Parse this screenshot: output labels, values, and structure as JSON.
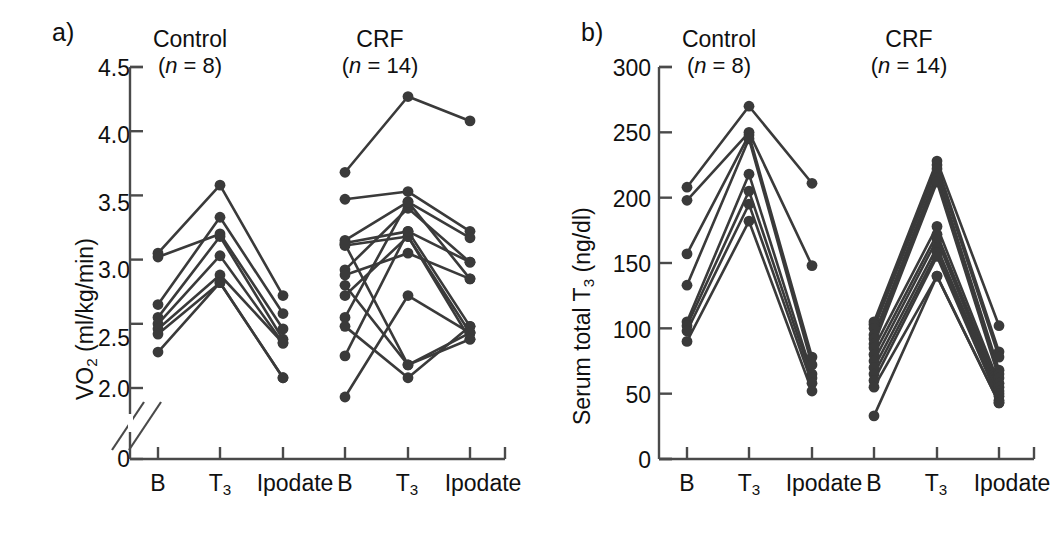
{
  "figure": {
    "panel_a_label": "a)",
    "panel_b_label": "b)"
  },
  "panel_a": {
    "ylabel_main": "VO",
    "ylabel_sub": "2",
    "ylabel_rest": " (ml/kg/min)",
    "ylabel_full": "VO2 (ml/kg/min)",
    "groups": [
      {
        "name": "Control",
        "n_text": "n",
        "n_value": " = 8)",
        "n_open": "("
      },
      {
        "name": "CRF",
        "n_text": "n",
        "n_value": " = 14)",
        "n_open": "("
      }
    ],
    "ytick_labels": [
      "4.5",
      "4.0",
      "3.5",
      "3.0",
      "2.5",
      "2.0",
      "0"
    ],
    "xtick_labels": [
      "B",
      "T3",
      "Ipodate",
      "B",
      "T3",
      "Ipodate"
    ],
    "xtick_base": [
      "B",
      "T",
      "Ipodate",
      "B",
      "T",
      "Ipodate"
    ],
    "xtick_sub": [
      "",
      "3",
      "",
      "",
      "3",
      ""
    ]
  },
  "panel_b": {
    "ylabel_main": "Serum total T",
    "ylabel_sub": "3",
    "ylabel_rest": " (ng/dl)",
    "ylabel_full": "Serum total T3 (ng/dl)",
    "groups": [
      {
        "name": "Control",
        "n_text": "n",
        "n_value": " = 8)",
        "n_open": "("
      },
      {
        "name": "CRF",
        "n_text": "n",
        "n_value": " = 14)",
        "n_open": "("
      }
    ],
    "ytick_labels": [
      "300",
      "250",
      "200",
      "150",
      "100",
      "50",
      "0"
    ],
    "xtick_labels": [
      "B",
      "T3",
      "Ipodate",
      "B",
      "T3",
      "Ipodate"
    ],
    "xtick_base": [
      "B",
      "T",
      "Ipodate",
      "B",
      "T",
      "Ipodate"
    ],
    "xtick_sub": [
      "",
      "3",
      "",
      "",
      "3",
      ""
    ]
  },
  "chart_data": [
    {
      "panel": "a",
      "type": "line",
      "title": "",
      "xlabel": "",
      "ylabel": "VO2 (ml/kg/min)",
      "ylim": [
        2.0,
        4.5
      ],
      "yticks": [
        2.0,
        2.5,
        3.0,
        3.5,
        4.0,
        4.5
      ],
      "y_axis_break": true,
      "y_break_note": "axis broken between 0 and 2.0",
      "grid": false,
      "legend": "none",
      "categories": [
        "B",
        "T3",
        "Ipodate"
      ],
      "groups": [
        {
          "name": "Control",
          "n": 8,
          "series": [
            {
              "name": "c1",
              "values": [
                3.05,
                3.58,
                2.72
              ]
            },
            {
              "name": "c2",
              "values": [
                3.02,
                3.2,
                2.46
              ]
            },
            {
              "name": "c3",
              "values": [
                2.65,
                3.33,
                2.58
              ]
            },
            {
              "name": "c4",
              "values": [
                2.55,
                3.18,
                2.38
              ]
            },
            {
              "name": "c5",
              "values": [
                2.5,
                3.03,
                2.35
              ]
            },
            {
              "name": "c6",
              "values": [
                2.46,
                2.88,
                2.35
              ]
            },
            {
              "name": "c7",
              "values": [
                2.42,
                2.82,
                2.08
              ]
            },
            {
              "name": "c8",
              "values": [
                2.28,
                2.82,
                2.08
              ]
            }
          ]
        },
        {
          "name": "CRF",
          "n": 14,
          "series": [
            {
              "name": "r1",
              "values": [
                3.68,
                4.27,
                4.08
              ]
            },
            {
              "name": "r2",
              "values": [
                3.47,
                3.53,
                3.22
              ]
            },
            {
              "name": "r3",
              "values": [
                3.15,
                3.45,
                3.17
              ]
            },
            {
              "name": "r4",
              "values": [
                3.13,
                3.22,
                2.48
              ]
            },
            {
              "name": "r5",
              "values": [
                3.11,
                3.18,
                2.43
              ]
            },
            {
              "name": "r6",
              "values": [
                2.92,
                3.4,
                2.98
              ]
            },
            {
              "name": "r7",
              "values": [
                2.88,
                3.05,
                2.85
              ]
            },
            {
              "name": "r8",
              "values": [
                2.8,
                2.18,
                2.43
              ]
            },
            {
              "name": "r9",
              "values": [
                2.72,
                3.18,
                2.38
              ]
            },
            {
              "name": "r10",
              "values": [
                2.55,
                3.45,
                2.85
              ]
            },
            {
              "name": "r11",
              "values": [
                2.48,
                2.08,
                2.48
              ]
            },
            {
              "name": "r12",
              "values": [
                2.25,
                3.22,
                2.98
              ]
            },
            {
              "name": "r13",
              "values": [
                1.93,
                2.72,
                2.43
              ]
            },
            {
              "name": "r14",
              "values": [
                3.12,
                2.18,
                2.38
              ]
            }
          ]
        }
      ]
    },
    {
      "panel": "b",
      "type": "line",
      "title": "",
      "xlabel": "",
      "ylabel": "Serum total T3 (ng/dl)",
      "ylim": [
        0,
        300
      ],
      "yticks": [
        0,
        50,
        100,
        150,
        200,
        250,
        300
      ],
      "y_axis_break": false,
      "grid": false,
      "legend": "none",
      "categories": [
        "B",
        "T3",
        "Ipodate"
      ],
      "groups": [
        {
          "name": "Control",
          "n": 8,
          "series": [
            {
              "name": "c1",
              "values": [
                208,
                270,
                211
              ]
            },
            {
              "name": "c2",
              "values": [
                198,
                250,
                148
              ]
            },
            {
              "name": "c3",
              "values": [
                157,
                248,
                78
              ]
            },
            {
              "name": "c4",
              "values": [
                133,
                245,
                72
              ]
            },
            {
              "name": "c5",
              "values": [
                105,
                218,
                65
              ]
            },
            {
              "name": "c6",
              "values": [
                102,
                205,
                62
              ]
            },
            {
              "name": "c7",
              "values": [
                98,
                195,
                58
              ]
            },
            {
              "name": "c8",
              "values": [
                90,
                182,
                52
              ]
            }
          ]
        },
        {
          "name": "CRF",
          "n": 14,
          "series": [
            {
              "name": "r1",
              "values": [
                105,
                228,
                102
              ]
            },
            {
              "name": "r2",
              "values": [
                103,
                225,
                82
              ]
            },
            {
              "name": "r3",
              "values": [
                100,
                222,
                78
              ]
            },
            {
              "name": "r4",
              "values": [
                95,
                218,
                68
              ]
            },
            {
              "name": "r5",
              "values": [
                92,
                215,
                65
              ]
            },
            {
              "name": "r6",
              "values": [
                88,
                212,
                62
              ]
            },
            {
              "name": "r7",
              "values": [
                85,
                178,
                58
              ]
            },
            {
              "name": "r8",
              "values": [
                80,
                172,
                55
              ]
            },
            {
              "name": "r9",
              "values": [
                75,
                168,
                52
              ]
            },
            {
              "name": "r10",
              "values": [
                70,
                162,
                50
              ]
            },
            {
              "name": "r11",
              "values": [
                65,
                158,
                48
              ]
            },
            {
              "name": "r12",
              "values": [
                60,
                155,
                45
              ]
            },
            {
              "name": "r13",
              "values": [
                55,
                140,
                43
              ]
            },
            {
              "name": "r14",
              "values": [
                33,
                140,
                43
              ]
            }
          ]
        }
      ]
    }
  ],
  "style": {
    "marker_color": "#3a3a3a",
    "line_color": "#3a3a3a",
    "axis_color": "#4a4a4a"
  }
}
